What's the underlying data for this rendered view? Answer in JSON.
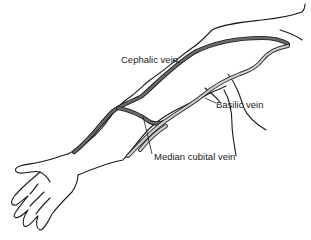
{
  "diagram": {
    "colors": {
      "background": "#ffffff",
      "outline": "#1a1a1a",
      "cephalic_fill": "#6a6a6a",
      "basilic_fill": "#cfcfcf"
    },
    "labels": [
      {
        "id": "cephalic",
        "text": "Cephalic vein",
        "x": 121,
        "y": 55
      },
      {
        "id": "basilic",
        "text": "Basilic vein",
        "x": 216,
        "y": 100
      },
      {
        "id": "median-cubital",
        "text": "Median cubital vein",
        "x": 154,
        "y": 152
      }
    ]
  }
}
